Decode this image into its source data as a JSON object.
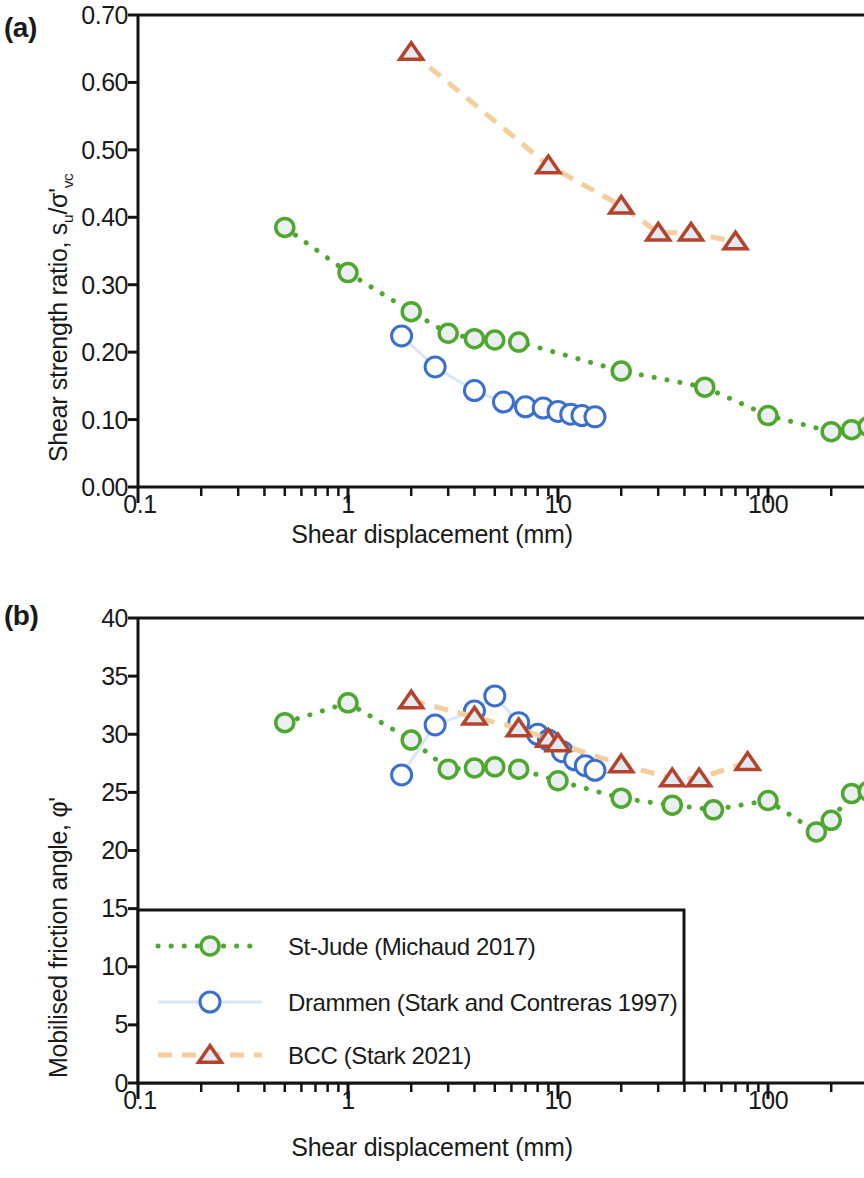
{
  "figure": {
    "panels": [
      {
        "tag": "(a)",
        "ylabel_prefix": "Shear strength ratio, s",
        "ylabel_sub1": "u",
        "ylabel_mid": "/σ'",
        "ylabel_sub2": "vc",
        "xlabel": "Shear displacement (mm)"
      },
      {
        "tag": "(b)",
        "ylabel": "Mobilised friction angle, φ'",
        "xlabel": "Shear displacement (mm)"
      }
    ]
  },
  "legend": {
    "entries": [
      {
        "label": "St-Jude (Michaud 2017)",
        "color": "#4ea72e",
        "marker": "circle",
        "line": "dotted"
      },
      {
        "label": "Drammen (Stark and Contreras 1997)",
        "color": "#3b6fce",
        "marker": "circle",
        "line": "solid-light"
      },
      {
        "label": "BCC (Stark 2021)",
        "color": "#b5432c",
        "marker": "triangle",
        "line": "dashed"
      }
    ]
  },
  "colors": {
    "st_jude": "#4ea72e",
    "st_jude_fill": "#eceff1",
    "drammen": "#3b6fce",
    "drammen_line": "#d9e6fb",
    "bcc": "#b5432c",
    "bcc_line": "#f5ce9e",
    "bcc_fill": "#e3eaf1",
    "axis": "#141414"
  },
  "chart_data": [
    {
      "type": "scatter",
      "panel": "(a)",
      "title": "",
      "xlabel": "Shear displacement (mm)",
      "ylabel": "Shear strength ratio, su/σ'vc",
      "xscale": "log",
      "xlim": [
        0.1,
        300
      ],
      "ylim": [
        0.0,
        0.7
      ],
      "xticks": [
        0.1,
        1,
        10,
        100
      ],
      "xtick_labels": [
        "0.1",
        "1",
        "10",
        "100"
      ],
      "yticks": [
        0.0,
        0.1,
        0.2,
        0.3,
        0.4,
        0.5,
        0.6,
        0.7
      ],
      "ytick_labels": [
        "0.00",
        "0.10",
        "0.20",
        "0.30",
        "0.40",
        "0.50",
        "0.60",
        "0.70"
      ],
      "grid": false,
      "legend_position": "none",
      "series": [
        {
          "name": "St-Jude (Michaud 2017)",
          "marker": "circle",
          "color": "#4ea72e",
          "x": [
            0.5,
            1.0,
            2.0,
            3.0,
            4.0,
            5.0,
            6.5,
            20.0,
            50.0,
            100.0,
            200.0,
            250.0,
            300.0
          ],
          "y": [
            0.385,
            0.318,
            0.26,
            0.228,
            0.22,
            0.218,
            0.215,
            0.172,
            0.148,
            0.106,
            0.082,
            0.085,
            0.09
          ]
        },
        {
          "name": "Drammen (Stark and Contreras 1997)",
          "marker": "circle-open",
          "color": "#3b6fce",
          "x": [
            1.8,
            2.6,
            4.0,
            5.5,
            7.0,
            8.5,
            10.0,
            11.5,
            13.0,
            15.0
          ],
          "y": [
            0.224,
            0.178,
            0.143,
            0.126,
            0.119,
            0.117,
            0.112,
            0.108,
            0.106,
            0.104
          ]
        },
        {
          "name": "BCC (Stark 2021)",
          "marker": "triangle-open",
          "color": "#b5432c",
          "x": [
            2.0,
            9.0,
            20.0,
            30.0,
            43.0,
            70.0
          ],
          "y": [
            0.645,
            0.477,
            0.417,
            0.377,
            0.377,
            0.364
          ]
        }
      ]
    },
    {
      "type": "scatter",
      "panel": "(b)",
      "title": "",
      "xlabel": "Shear displacement (mm)",
      "ylabel": "Mobilised friction angle, φ'",
      "xscale": "log",
      "xlim": [
        0.1,
        300
      ],
      "ylim": [
        0,
        40
      ],
      "xticks": [
        0.1,
        1,
        10,
        100
      ],
      "xtick_labels": [
        "0.1",
        "1",
        "10",
        "100"
      ],
      "yticks": [
        0,
        5,
        10,
        15,
        20,
        25,
        30,
        35,
        40
      ],
      "ytick_labels": [
        "0",
        "5",
        "10",
        "15",
        "20",
        "25",
        "30",
        "35",
        "40"
      ],
      "grid": false,
      "legend_position": "lower-left",
      "series": [
        {
          "name": "St-Jude (Michaud 2017)",
          "marker": "circle",
          "color": "#4ea72e",
          "x": [
            0.5,
            1.0,
            2.0,
            3.0,
            4.0,
            5.0,
            6.5,
            10.0,
            20.0,
            35.0,
            55.0,
            100.0,
            170.0,
            200.0,
            250.0,
            300.0
          ],
          "y": [
            31.0,
            32.7,
            29.5,
            27.0,
            27.1,
            27.2,
            27.0,
            26.0,
            24.5,
            23.9,
            23.5,
            24.3,
            21.6,
            22.6,
            24.9,
            25.1
          ]
        },
        {
          "name": "Drammen (Stark and Contreras 1997)",
          "marker": "circle-open",
          "color": "#3b6fce",
          "x": [
            1.8,
            2.6,
            4.0,
            5.0,
            6.5,
            8.0,
            9.0,
            10.5,
            12.0,
            13.5,
            15.0
          ],
          "y": [
            26.5,
            30.8,
            32.0,
            33.3,
            31.0,
            30.0,
            29.5,
            28.5,
            27.8,
            27.3,
            26.9
          ]
        },
        {
          "name": "BCC (Stark 2021)",
          "marker": "triangle-open",
          "color": "#b5432c",
          "x": [
            2.0,
            4.0,
            6.5,
            9.0,
            10.0,
            20.0,
            35.0,
            47.0,
            80.0
          ],
          "y": [
            32.9,
            31.5,
            30.5,
            29.6,
            29.2,
            27.4,
            26.2,
            26.2,
            27.6
          ]
        }
      ]
    }
  ]
}
